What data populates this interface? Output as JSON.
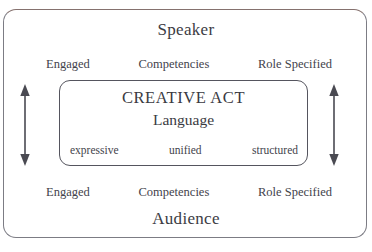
{
  "diagram": {
    "title_top": "Speaker",
    "title_bottom": "Audience",
    "inner": {
      "heading": "CREATIVE ACT",
      "subheading": "Language",
      "qualities": {
        "left": "expressive",
        "center": "unified",
        "right": "structured"
      }
    },
    "attributes_top": {
      "left": "Engaged",
      "center": "Competencies",
      "right": "Role Specified"
    },
    "attributes_bottom": {
      "left": "Engaged",
      "center": "Competencies",
      "right": "Role Specified"
    },
    "arrows": {
      "left_icon": "double-headed-vertical-arrow-icon",
      "right_icon": "double-headed-vertical-arrow-icon"
    },
    "colors": {
      "outer_border": "#7c7c84",
      "outer_border_top": "#85716e",
      "inner_border": "#55555e",
      "text": "#3a3a42",
      "arrow": "#4a4a52",
      "background": "#ffffff"
    }
  }
}
